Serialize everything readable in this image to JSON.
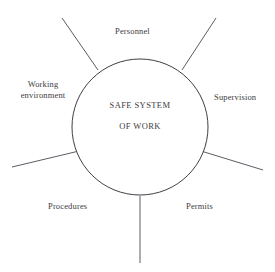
{
  "diagram": {
    "type": "radial-hub-and-spoke",
    "background_color": "#ffffff",
    "stroke_color": "#4a4a52",
    "text_color": "#3c3c3c",
    "center": {
      "line1": "SAFE SYSTEM",
      "line2": "OF WORK",
      "shape": "circle",
      "cx": 140,
      "cy": 127,
      "r": 68
    },
    "spokes": [
      {
        "name": "upper-left-spoke",
        "x1": 62,
        "y1": 18,
        "x2": 98,
        "y2": 70
      },
      {
        "name": "upper-right-spoke",
        "x1": 216,
        "y1": 18,
        "x2": 182,
        "y2": 70
      },
      {
        "name": "lower-left-spoke",
        "x1": 12,
        "y1": 167,
        "x2": 79,
        "y2": 151
      },
      {
        "name": "lower-right-spoke",
        "x1": 263,
        "y1": 170,
        "x2": 201,
        "y2": 151
      },
      {
        "name": "bottom-spoke",
        "x1": 140,
        "y1": 196,
        "x2": 140,
        "y2": 263
      }
    ],
    "labels": {
      "personnel": "Personnel",
      "working_environment_line1": "Working",
      "working_environment_line2": "environment",
      "supervision": "Supervision",
      "procedures": "Procedures",
      "permits": "Permits"
    }
  }
}
